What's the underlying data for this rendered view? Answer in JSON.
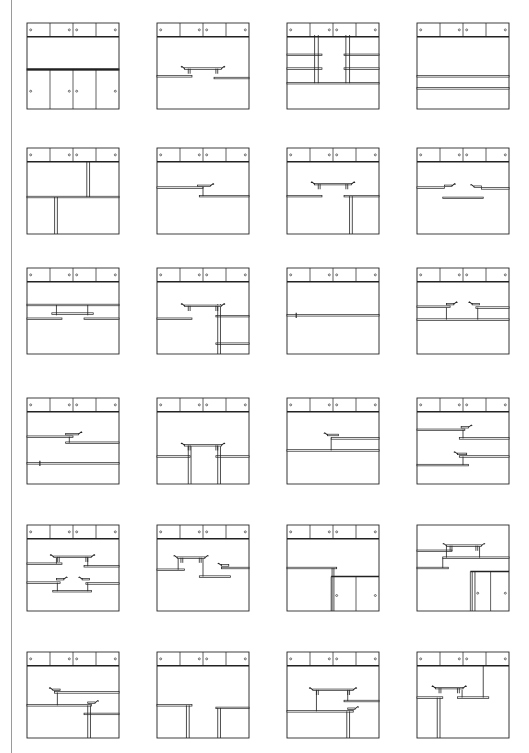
{
  "figure": {
    "grid": {
      "columns": 4,
      "rows": 6
    },
    "col_x": [
      27,
      157,
      287,
      417
    ],
    "row_y": [
      23,
      148,
      268,
      398,
      525,
      652
    ],
    "line_color": "#222222"
  },
  "panels": [
    {
      "id": "r1c1",
      "top": true,
      "shelves": [
        [
          0,
          100,
          54
        ]
      ],
      "posts": [],
      "consoles": [],
      "bottomDoors": {
        "y": 54,
        "knobs": true,
        "splits": [
          25,
          50,
          75
        ]
      }
    },
    {
      "id": "r1c2",
      "top": true,
      "shelves": [
        [
          0,
          38,
          62
        ],
        [
          62,
          100,
          64
        ]
      ],
      "posts": [],
      "consoles": [
        [
          28,
          72,
          53
        ]
      ],
      "bottomDoors": null
    },
    {
      "id": "r1c3",
      "top": true,
      "shelves": [
        [
          0,
          100,
          70
        ],
        [
          0,
          38,
          37
        ],
        [
          0,
          38,
          53
        ],
        [
          62,
          100,
          37
        ],
        [
          62,
          100,
          53
        ]
      ],
      "posts": [
        [
          30,
          14,
          70
        ],
        [
          34,
          14,
          70
        ],
        [
          64,
          14,
          70
        ],
        [
          68,
          14,
          70
        ]
      ],
      "consoles": [],
      "bottomDoors": null
    },
    {
      "id": "r1c4",
      "top": true,
      "shelves": [
        [
          0,
          100,
          62
        ],
        [
          0,
          100,
          76
        ]
      ],
      "posts": [],
      "consoles": [],
      "bottomDoors": null
    },
    {
      "id": "r2c1",
      "top": true,
      "shelves": [
        [
          0,
          100,
          57
        ]
      ],
      "posts": [
        [
          65,
          16,
          57
        ],
        [
          68,
          16,
          57
        ],
        [
          30,
          57,
          100
        ],
        [
          33,
          57,
          100
        ]
      ],
      "consoles": [],
      "bottomDoors": null
    },
    {
      "id": "r2c2",
      "top": true,
      "shelves": [
        [
          0,
          50,
          46
        ],
        [
          46,
          100,
          56
        ]
      ],
      "posts": [
        [
          50,
          44,
          56
        ]
      ],
      "consoles": [],
      "consolesRight": [
        [
          44,
          58,
          44
        ]
      ],
      "bottomDoors": null
    },
    {
      "id": "r2c3",
      "top": true,
      "shelves": [
        [
          0,
          38,
          56
        ],
        [
          62,
          100,
          56
        ]
      ],
      "posts": [
        [
          68,
          56,
          100
        ],
        [
          71,
          56,
          100
        ]
      ],
      "consoles": [
        [
          28,
          72,
          42
        ]
      ],
      "bottomDoors": null
    },
    {
      "id": "r2c4",
      "top": true,
      "shelves": [
        [
          0,
          30,
          46
        ],
        [
          70,
          100,
          47
        ],
        [
          28,
          72,
          58
        ]
      ],
      "posts": [],
      "consoles": [],
      "consolesSplit": [
        [
          30,
          38,
          44
        ],
        [
          62,
          70,
          45
        ]
      ],
      "bottomDoors": null
    },
    {
      "id": "r3c1",
      "top": true,
      "shelves": [
        [
          0,
          100,
          43
        ],
        [
          0,
          38,
          59
        ],
        [
          62,
          100,
          59
        ]
      ],
      "posts": [
        [
          32,
          43,
          55
        ],
        [
          66,
          43,
          55
        ]
      ],
      "consoles": [],
      "shelfExtra": [
        [
          27,
          72,
          53
        ]
      ],
      "bottomDoors": null
    },
    {
      "id": "r3c2",
      "top": true,
      "shelves": [
        [
          0,
          38,
          59
        ],
        [
          64,
          100,
          56
        ],
        [
          64,
          100,
          88
        ]
      ],
      "posts": [
        [
          66,
          42,
          100
        ],
        [
          69,
          42,
          100
        ]
      ],
      "consoles": [
        [
          28,
          72,
          44
        ]
      ],
      "bottomDoors": null
    },
    {
      "id": "r3c3",
      "top": true,
      "shelves": [
        [
          0,
          100,
          55
        ]
      ],
      "posts": [],
      "consoles": [],
      "tick": [
        [
          10,
          55
        ]
      ],
      "bottomDoors": null
    },
    {
      "id": "r3c4",
      "top": true,
      "shelves": [
        [
          0,
          36,
          45
        ],
        [
          64,
          100,
          46
        ],
        [
          0,
          100,
          60
        ]
      ],
      "posts": [
        [
          32,
          46,
          60
        ],
        [
          66,
          46,
          60
        ]
      ],
      "consoles": [],
      "consolesSplit": [
        [
          32,
          40,
          42
        ],
        [
          60,
          68,
          42
        ]
      ],
      "bottomDoors": null
    },
    {
      "id": "r4c1",
      "top": true,
      "shelves": [
        [
          0,
          50,
          45
        ],
        [
          42,
          100,
          52
        ],
        [
          0,
          100,
          76
        ]
      ],
      "posts": [
        [
          46,
          45,
          52
        ]
      ],
      "consoles": [],
      "consolesRight": [
        [
          42,
          56,
          42
        ]
      ],
      "tick": [
        [
          14,
          76
        ]
      ],
      "bottomDoors": null
    },
    {
      "id": "r4c2",
      "top": true,
      "shelves": [
        [
          0,
          36,
          68
        ],
        [
          64,
          100,
          68
        ]
      ],
      "posts": [
        [
          34,
          56,
          100
        ],
        [
          37,
          56,
          100
        ],
        [
          66,
          56,
          100
        ],
        [
          69,
          56,
          100
        ]
      ],
      "consoles": [
        [
          28,
          72,
          55
        ]
      ],
      "bottomDoors": null
    },
    {
      "id": "r4c3",
      "top": true,
      "shelves": [
        [
          48,
          100,
          47
        ],
        [
          0,
          100,
          61
        ]
      ],
      "posts": [
        [
          48,
          47,
          61
        ]
      ],
      "consoles": [],
      "consolesLeft": [
        [
          44,
          56,
          43
        ]
      ],
      "bottomDoors": null
    },
    {
      "id": "r4c4",
      "top": true,
      "shelves": [
        [
          0,
          52,
          37
        ],
        [
          46,
          100,
          47
        ],
        [
          46,
          100,
          68
        ],
        [
          0,
          56,
          78
        ]
      ],
      "posts": [
        [
          50,
          37,
          47
        ],
        [
          50,
          68,
          78
        ]
      ],
      "consoles": [],
      "consolesRight": [
        [
          48,
          56,
          34
        ]
      ],
      "consolesLeft": [
        [
          44,
          54,
          65
        ]
      ],
      "bottomDoors": null
    },
    {
      "id": "r5c1",
      "top": true,
      "shelves": [
        [
          0,
          38,
          45
        ],
        [
          62,
          100,
          48
        ],
        [
          0,
          36,
          67
        ],
        [
          64,
          100,
          68
        ],
        [
          28,
          70,
          77
        ]
      ],
      "posts": [
        [
          32,
          38,
          45
        ],
        [
          66,
          38,
          48
        ],
        [
          33,
          67,
          77
        ],
        [
          66,
          67,
          77
        ]
      ],
      "consoles": [
        [
          27,
          72,
          37
        ]
      ],
      "consolesSplit": [
        [
          32,
          40,
          63
        ],
        [
          60,
          68,
          63
        ]
      ],
      "bottomDoors": null
    },
    {
      "id": "r5c2",
      "top": true,
      "shelves": [
        [
          0,
          30,
          52
        ],
        [
          46,
          80,
          60
        ],
        [
          70,
          100,
          50
        ]
      ],
      "posts": [
        [
          23,
          38,
          52
        ],
        [
          50,
          38,
          60
        ]
      ],
      "consoles": [
        [
          20,
          54,
          38
        ]
      ],
      "consolesLeft": [
        [
          70,
          78,
          47
        ]
      ],
      "bottomDoors": null
    },
    {
      "id": "r5c3",
      "top": true,
      "shelves": [
        [
          0,
          54,
          50
        ]
      ],
      "posts": [
        [
          49,
          50,
          100
        ],
        [
          51,
          50,
          100
        ]
      ],
      "consoles": [],
      "bottomDoors": {
        "y": 60,
        "knobs": true,
        "splits": [
          75
        ],
        "left": 48,
        "right": 100,
        "knobsPos": [
          54,
          96
        ]
      }
    },
    {
      "id": "r5c4",
      "top": false,
      "shelves": [
        [
          0,
          38,
          30
        ],
        [
          28,
          100,
          38
        ],
        [
          0,
          34,
          50
        ]
      ],
      "posts": [
        [
          32,
          24,
          38
        ],
        [
          68,
          24,
          38
        ],
        [
          28,
          38,
          50
        ]
      ],
      "consoles": [
        [
          30,
          72,
          24
        ]
      ],
      "bottomDoors": {
        "y": 54,
        "knobs": true,
        "splits": [
          80
        ],
        "left": 58,
        "right": 100,
        "knobsPos": [
          66,
          96
        ]
      },
      "bottomPosts": [
        [
          60,
          54,
          100
        ],
        [
          63,
          54,
          100
        ]
      ]
    },
    {
      "id": "r6c1",
      "top": true,
      "shelves": [
        [
          30,
          100,
          47
        ],
        [
          0,
          70,
          62
        ],
        [
          62,
          100,
          72
        ]
      ],
      "posts": [
        [
          33,
          47,
          62
        ],
        [
          66,
          62,
          100
        ],
        [
          69,
          62,
          100
        ]
      ],
      "consoles": [],
      "consolesLeft": [
        [
          28,
          36,
          44
        ]
      ],
      "consolesRight": [
        [
          66,
          74,
          59
        ]
      ],
      "bottomDoors": null
    },
    {
      "id": "r6c2",
      "top": true,
      "shelves": [
        [
          0,
          38,
          62
        ],
        [
          64,
          100,
          65
        ]
      ],
      "posts": [
        [
          32,
          62,
          100
        ],
        [
          35,
          62,
          100
        ],
        [
          66,
          65,
          100
        ],
        [
          69,
          65,
          100
        ]
      ],
      "consoles": [],
      "bottomDoors": null
    },
    {
      "id": "r6c3",
      "top": true,
      "shelves": [
        [
          62,
          100,
          57
        ],
        [
          0,
          72,
          69
        ]
      ],
      "posts": [
        [
          32,
          44,
          69
        ],
        [
          66,
          44,
          57
        ],
        [
          65,
          69,
          100
        ],
        [
          68,
          69,
          100
        ]
      ],
      "consoles": [
        [
          26,
          74,
          44
        ]
      ],
      "consolesRight": [
        [
          66,
          74,
          66
        ]
      ],
      "bottomDoors": null
    },
    {
      "id": "r6c4",
      "top": true,
      "shelves": [
        [
          0,
          28,
          53
        ],
        [
          44,
          78,
          53
        ]
      ],
      "posts": [
        [
          22,
          53,
          100
        ],
        [
          25,
          53,
          100
        ],
        [
          72,
          16,
          53
        ],
        [
          49,
          44,
          53
        ]
      ],
      "consoles": [
        [
          18,
          52,
          42
        ]
      ],
      "bottomDoors": null
    }
  ]
}
